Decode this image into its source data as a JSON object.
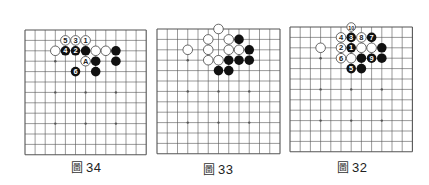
{
  "colors": {
    "line": "#555555",
    "black_stone": "#111111",
    "white_stone": "#ffffff",
    "white_stroke": "#444444",
    "label_on_black": "#ffffff",
    "label_on_white": "#222222"
  },
  "boards": [
    {
      "id": "fig34",
      "origin": [
        25,
        30
      ],
      "spacing": [
        10.1,
        10.4
      ],
      "lines": 13,
      "star_points": [
        [
          3,
          3
        ],
        [
          6,
          3
        ],
        [
          9,
          3
        ],
        [
          3,
          6
        ],
        [
          6,
          6
        ],
        [
          9,
          6
        ],
        [
          3,
          9
        ],
        [
          6,
          9
        ],
        [
          9,
          9
        ]
      ],
      "stones": [
        {
          "c": 4,
          "r": 1,
          "color": "white",
          "label": "5"
        },
        {
          "c": 5,
          "r": 1,
          "color": "white",
          "label": "3"
        },
        {
          "c": 6,
          "r": 1,
          "color": "white",
          "label": "1"
        },
        {
          "c": 3,
          "r": 2,
          "color": "white",
          "label": ""
        },
        {
          "c": 4,
          "r": 2,
          "color": "black",
          "label": "4"
        },
        {
          "c": 5,
          "r": 2,
          "color": "black",
          "label": "2"
        },
        {
          "c": 6,
          "r": 2,
          "color": "black",
          "label": ""
        },
        {
          "c": 7,
          "r": 2,
          "color": "white",
          "label": ""
        },
        {
          "c": 8,
          "r": 2,
          "color": "white",
          "label": ""
        },
        {
          "c": 9,
          "r": 2,
          "color": "black",
          "label": ""
        },
        {
          "c": 6,
          "r": 3,
          "color": "white",
          "label": "A"
        },
        {
          "c": 7,
          "r": 3,
          "color": "black",
          "label": ""
        },
        {
          "c": 9,
          "r": 3,
          "color": "black",
          "label": ""
        },
        {
          "c": 5,
          "r": 4,
          "color": "black",
          "label": "6"
        },
        {
          "c": 7,
          "r": 4,
          "color": "black",
          "label": ""
        }
      ],
      "caption": {
        "prefix": "圖",
        "number": "34",
        "x": 86,
        "y": 158
      }
    },
    {
      "id": "fig33",
      "origin": [
        156.5,
        29
      ],
      "spacing": [
        10.25,
        10.4
      ],
      "lines": 13,
      "star_points": [
        [
          3,
          3
        ],
        [
          6,
          3
        ],
        [
          9,
          3
        ],
        [
          3,
          6
        ],
        [
          6,
          6
        ],
        [
          9,
          6
        ],
        [
          3,
          9
        ],
        [
          6,
          9
        ],
        [
          9,
          9
        ]
      ],
      "stones": [
        {
          "c": 6,
          "r": 0,
          "color": "white",
          "label": ""
        },
        {
          "c": 5,
          "r": 1,
          "color": "white",
          "label": ""
        },
        {
          "c": 7,
          "r": 1,
          "color": "white",
          "label": ""
        },
        {
          "c": 8,
          "r": 1,
          "color": "black",
          "label": ""
        },
        {
          "c": 3,
          "r": 2,
          "color": "white",
          "label": ""
        },
        {
          "c": 5,
          "r": 2,
          "color": "white",
          "label": ""
        },
        {
          "c": 7,
          "r": 2,
          "color": "white",
          "label": ""
        },
        {
          "c": 8,
          "r": 2,
          "color": "white",
          "label": ""
        },
        {
          "c": 9,
          "r": 2,
          "color": "black",
          "label": ""
        },
        {
          "c": 5,
          "r": 3,
          "color": "white",
          "label": ""
        },
        {
          "c": 6,
          "r": 3,
          "color": "white",
          "label": ""
        },
        {
          "c": 7,
          "r": 3,
          "color": "black",
          "label": ""
        },
        {
          "c": 8,
          "r": 3,
          "color": "black",
          "label": ""
        },
        {
          "c": 9,
          "r": 3,
          "color": "black",
          "label": ""
        },
        {
          "c": 6,
          "r": 4,
          "color": "black",
          "label": ""
        },
        {
          "c": 7,
          "r": 4,
          "color": "black",
          "label": ""
        }
      ],
      "caption": {
        "prefix": "圖",
        "number": "33",
        "x": 218,
        "y": 160
      }
    },
    {
      "id": "fig32",
      "origin": [
        289.7,
        27.3
      ],
      "spacing": [
        10.2,
        10.4
      ],
      "lines": 13,
      "star_points": [
        [
          3,
          3
        ],
        [
          6,
          3
        ],
        [
          9,
          3
        ],
        [
          3,
          6
        ],
        [
          6,
          6
        ],
        [
          9,
          6
        ],
        [
          3,
          9
        ],
        [
          6,
          9
        ],
        [
          9,
          9
        ]
      ],
      "stones": [
        {
          "c": 6,
          "r": 0,
          "color": "white",
          "label": "10"
        },
        {
          "c": 5,
          "r": 1,
          "color": "white",
          "label": "4"
        },
        {
          "c": 6,
          "r": 1,
          "color": "black",
          "label": "3"
        },
        {
          "c": 7,
          "r": 1,
          "color": "white",
          "label": "8"
        },
        {
          "c": 8,
          "r": 1,
          "color": "black",
          "label": "7"
        },
        {
          "c": 3,
          "r": 2,
          "color": "white",
          "label": ""
        },
        {
          "c": 5,
          "r": 2,
          "color": "white",
          "label": "2"
        },
        {
          "c": 6,
          "r": 2,
          "color": "black",
          "label": "1"
        },
        {
          "c": 7,
          "r": 2,
          "color": "white",
          "label": ""
        },
        {
          "c": 8,
          "r": 2,
          "color": "white",
          "label": ""
        },
        {
          "c": 9,
          "r": 2,
          "color": "black",
          "label": ""
        },
        {
          "c": 5,
          "r": 3,
          "color": "white",
          "label": "6"
        },
        {
          "c": 6,
          "r": 3,
          "color": "white",
          "label": ""
        },
        {
          "c": 7,
          "r": 3,
          "color": "black",
          "label": ""
        },
        {
          "c": 8,
          "r": 3,
          "color": "black",
          "label": "9"
        },
        {
          "c": 9,
          "r": 3,
          "color": "black",
          "label": ""
        },
        {
          "c": 6,
          "r": 4,
          "color": "black",
          "label": "5"
        },
        {
          "c": 7,
          "r": 4,
          "color": "black",
          "label": ""
        }
      ],
      "caption": {
        "prefix": "圖",
        "number": "32",
        "x": 352,
        "y": 158
      }
    }
  ]
}
